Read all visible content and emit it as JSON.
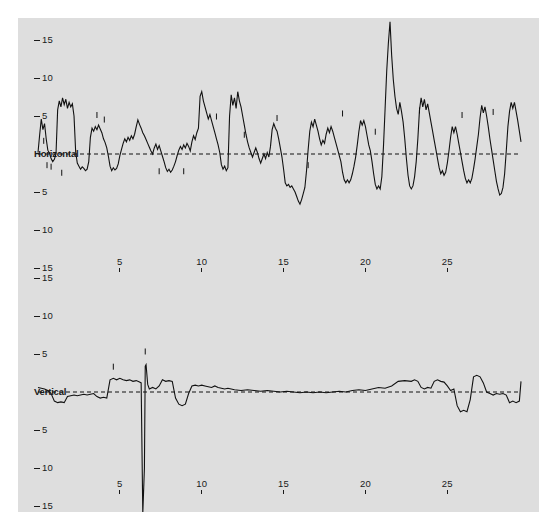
{
  "figure": {
    "background_color": "#ffffff",
    "plot_background_color": "#dedede",
    "line_color": "#111111",
    "zero_line_color": "#111111"
  },
  "chart_data": {
    "type": "line",
    "title": "",
    "subtitle": "",
    "xlabel": "",
    "ylabel": "",
    "grid": false,
    "legend_position": "none",
    "panels": [
      {
        "name": "horizontal",
        "center_label": "Horizontal",
        "ylabel": "",
        "ylim": [
          -18,
          18
        ],
        "xlim": [
          0,
          29.5
        ],
        "y_ticks": [
          15,
          10,
          5,
          0,
          -5,
          -10,
          -15
        ],
        "y_tick_labels": [
          "15",
          "10",
          "5",
          "Horizontal",
          "5",
          "10",
          "15"
        ],
        "x_ticks": [
          5,
          10,
          15,
          20,
          25
        ],
        "x_tick_labels": [
          "5",
          "10",
          "15",
          "20",
          "25"
        ],
        "zero_line": 0,
        "zero_line_style": "dashed",
        "x": [
          0.0,
          0.1,
          0.2,
          0.3,
          0.4,
          0.5,
          0.6,
          0.7,
          0.8,
          0.9,
          1.0,
          1.1,
          1.2,
          1.3,
          1.4,
          1.5,
          1.6,
          1.7,
          1.8,
          1.9,
          2.0,
          2.1,
          2.2,
          2.3,
          2.4,
          2.5,
          2.6,
          2.7,
          2.8,
          2.9,
          3.0,
          3.1,
          3.2,
          3.3,
          3.4,
          3.5,
          3.6,
          3.7,
          3.8,
          3.9,
          4.0,
          4.1,
          4.2,
          4.3,
          4.4,
          4.5,
          4.6,
          4.7,
          4.8,
          4.9,
          5.0,
          5.1,
          5.2,
          5.3,
          5.4,
          5.5,
          5.6,
          5.7,
          5.8,
          5.9,
          6.0,
          6.1,
          6.2,
          6.3,
          6.4,
          6.5,
          6.6,
          6.7,
          6.8,
          6.9,
          7.0,
          7.1,
          7.2,
          7.3,
          7.4,
          7.5,
          7.6,
          7.7,
          7.8,
          7.9,
          8.0,
          8.1,
          8.2,
          8.3,
          8.4,
          8.5,
          8.6,
          8.7,
          8.8,
          8.9,
          9.0,
          9.1,
          9.2,
          9.3,
          9.4,
          9.5,
          9.6,
          9.7,
          9.8,
          9.9,
          10.0,
          10.1,
          10.2,
          10.3,
          10.4,
          10.5,
          10.6,
          10.7,
          10.8,
          10.9,
          11.0,
          11.1,
          11.2,
          11.3,
          11.4,
          11.5,
          11.6,
          11.7,
          11.8,
          11.9,
          12.0,
          12.1,
          12.2,
          12.3,
          12.4,
          12.5,
          12.6,
          12.7,
          12.8,
          12.9,
          13.0,
          13.1,
          13.2,
          13.3,
          13.4,
          13.5,
          13.6,
          13.7,
          13.8,
          13.9,
          14.0,
          14.1,
          14.2,
          14.3,
          14.4,
          14.5,
          14.6,
          14.7,
          14.8,
          14.9,
          15.0,
          15.1,
          15.2,
          15.3,
          15.4,
          15.5,
          15.6,
          15.7,
          15.8,
          15.9,
          16.0,
          16.1,
          16.2,
          16.3,
          16.4,
          16.5,
          16.6,
          16.7,
          16.8,
          16.9,
          17.0,
          17.1,
          17.2,
          17.3,
          17.4,
          17.5,
          17.6,
          17.7,
          17.8,
          17.9,
          18.0,
          18.1,
          18.2,
          18.3,
          18.4,
          18.5,
          18.6,
          18.7,
          18.8,
          18.9,
          19.0,
          19.1,
          19.2,
          19.3,
          19.4,
          19.5,
          19.6,
          19.7,
          19.8,
          19.9,
          20.0,
          20.1,
          20.2,
          20.3,
          20.4,
          20.5,
          20.6,
          20.7,
          20.8,
          20.9,
          21.0,
          21.1,
          21.2,
          21.3,
          21.4,
          21.5,
          21.6,
          21.7,
          21.8,
          21.9,
          22.0,
          22.1,
          22.2,
          22.3,
          22.4,
          22.5,
          22.6,
          22.7,
          22.8,
          22.9,
          23.0,
          23.1,
          23.2,
          23.3,
          23.4,
          23.5,
          23.6,
          23.7,
          23.8,
          23.9,
          24.0,
          24.1,
          24.2,
          24.3,
          24.4,
          24.5,
          24.6,
          24.7,
          24.8,
          24.9,
          25.0,
          25.1,
          25.2,
          25.3,
          25.4,
          25.5,
          25.6,
          25.7,
          25.8,
          25.9,
          26.0,
          26.1,
          26.2,
          26.3,
          26.4,
          26.5,
          26.6,
          26.7,
          26.8,
          26.9,
          27.0,
          27.1,
          27.2,
          27.3,
          27.4,
          27.5,
          27.6,
          27.7,
          27.8,
          27.9,
          28.0,
          28.1,
          28.2,
          28.3,
          28.4,
          28.5,
          28.6,
          28.7,
          28.8,
          28.9,
          29.0,
          29.1,
          29.2,
          29.3,
          29.4,
          29.5
        ],
        "y": [
          0.2,
          2.5,
          4.6,
          3.2,
          4.0,
          2.0,
          0.5,
          0.1,
          -0.6,
          -1.0,
          -0.7,
          0.0,
          5.8,
          7.0,
          6.2,
          7.4,
          6.5,
          7.2,
          6.0,
          6.8,
          6.2,
          6.6,
          5.0,
          0.3,
          -1.2,
          -1.6,
          -2.0,
          -1.7,
          -1.9,
          -2.2,
          -2.0,
          -1.0,
          2.2,
          3.4,
          3.0,
          3.6,
          3.2,
          3.8,
          3.3,
          2.8,
          2.0,
          1.5,
          0.8,
          -0.3,
          -1.6,
          -2.2,
          -1.8,
          -2.1,
          -1.9,
          -1.3,
          -0.2,
          0.6,
          1.4,
          2.0,
          1.6,
          2.2,
          1.8,
          2.4,
          2.0,
          2.6,
          3.6,
          4.5,
          3.9,
          3.4,
          2.8,
          2.4,
          1.9,
          1.4,
          0.9,
          0.4,
          0.0,
          0.8,
          1.3,
          0.6,
          1.1,
          0.4,
          -0.3,
          -1.0,
          -1.8,
          -2.3,
          -2.0,
          -2.4,
          -2.1,
          -1.6,
          -1.0,
          -0.2,
          0.5,
          1.0,
          0.6,
          1.2,
          0.8,
          1.4,
          1.0,
          0.4,
          1.6,
          2.4,
          1.9,
          2.8,
          3.4,
          7.6,
          8.2,
          7.0,
          6.2,
          5.4,
          4.6,
          5.2,
          4.4,
          3.6,
          2.8,
          2.0,
          1.2,
          0.2,
          -1.4,
          -2.0,
          -1.6,
          -2.2,
          -1.8,
          5.0,
          7.8,
          6.4,
          7.4,
          6.0,
          8.2,
          7.0,
          6.2,
          5.0,
          3.8,
          2.6,
          1.6,
          0.8,
          0.2,
          -0.4,
          0.2,
          0.8,
          0.2,
          -0.6,
          -1.2,
          -0.6,
          0.0,
          -0.6,
          0.2,
          -0.4,
          1.0,
          3.2,
          4.0,
          3.4,
          3.0,
          2.0,
          0.8,
          -0.4,
          -2.0,
          -3.8,
          -4.2,
          -4.0,
          -4.4,
          -4.2,
          -4.6,
          -5.0,
          -5.6,
          -6.2,
          -6.6,
          -6.0,
          -5.2,
          -4.4,
          -2.2,
          0.6,
          3.0,
          4.2,
          3.6,
          4.6,
          3.8,
          3.0,
          2.0,
          1.2,
          1.8,
          1.4,
          2.6,
          3.4,
          2.8,
          3.6,
          3.0,
          2.2,
          1.4,
          0.6,
          -0.2,
          -1.0,
          -2.4,
          -3.4,
          -3.8,
          -3.4,
          -3.8,
          -3.4,
          -2.6,
          -1.6,
          -0.4,
          1.2,
          3.0,
          4.4,
          3.8,
          4.4,
          3.6,
          2.4,
          1.2,
          0.4,
          -1.0,
          -2.6,
          -4.0,
          -4.6,
          -4.2,
          -4.6,
          -3.0,
          1.0,
          6.0,
          11.0,
          14.6,
          17.4,
          13.0,
          9.8,
          7.6,
          6.0,
          5.2,
          6.8,
          5.6,
          4.2,
          2.0,
          -0.6,
          -2.8,
          -4.2,
          -4.6,
          -4.2,
          -3.0,
          -1.0,
          2.0,
          5.8,
          7.4,
          6.2,
          7.2,
          5.8,
          6.6,
          5.4,
          4.2,
          3.0,
          1.8,
          0.6,
          -0.6,
          -1.8,
          -2.6,
          -2.2,
          -2.8,
          -2.4,
          -1.2,
          0.4,
          2.2,
          3.6,
          2.8,
          3.6,
          2.6,
          1.4,
          0.2,
          -1.0,
          -2.2,
          -3.2,
          -3.8,
          -3.4,
          -3.8,
          -3.2,
          -2.0,
          -0.6,
          1.0,
          2.6,
          4.8,
          6.4,
          5.4,
          6.2,
          5.0,
          3.6,
          2.0,
          0.6,
          -0.8,
          -2.2,
          -3.6,
          -4.6,
          -5.4,
          -5.2,
          -4.4,
          -2.6,
          0.4,
          3.6,
          5.6,
          6.8,
          6.0,
          6.8,
          5.6,
          4.4,
          3.0,
          1.6,
          0.4,
          -0.8,
          -2.0,
          -3.0,
          -2.6,
          -3.0,
          -2.4,
          -1.2,
          0.6,
          2.6,
          4.6,
          5.8,
          5.0,
          5.8,
          4.6,
          3.2,
          1.8,
          0.6,
          -0.6,
          -1.6,
          -2.2,
          -1.8,
          -0.8,
          1.0,
          -1.0,
          -4.0,
          -7.6,
          -11.0,
          -14.2,
          -16.8,
          -18.0
        ],
        "event_markers": [
          {
            "x": 0.35,
            "y": 1.6
          },
          {
            "x": 0.55,
            "y": -1.6
          },
          {
            "x": 0.8,
            "y": -1.8
          },
          {
            "x": 1.45,
            "y": -2.6
          },
          {
            "x": 3.6,
            "y": 5.0
          },
          {
            "x": 4.05,
            "y": 4.4
          },
          {
            "x": 7.4,
            "y": -2.4
          },
          {
            "x": 8.9,
            "y": -2.4
          },
          {
            "x": 10.9,
            "y": 4.8
          },
          {
            "x": 12.6,
            "y": 2.4
          },
          {
            "x": 14.6,
            "y": 4.6
          },
          {
            "x": 16.5,
            "y": -1.6
          },
          {
            "x": 18.6,
            "y": 5.2
          },
          {
            "x": 20.6,
            "y": 2.8
          },
          {
            "x": 23.3,
            "y": 5.6
          },
          {
            "x": 25.9,
            "y": 5.0
          },
          {
            "x": 27.8,
            "y": 5.4
          }
        ]
      },
      {
        "name": "vertical",
        "center_label": "Vertical",
        "ylabel": "",
        "ylim": [
          -18,
          18
        ],
        "xlim": [
          0,
          29.5
        ],
        "y_ticks": [
          15,
          10,
          5,
          0,
          -5,
          -10,
          -15
        ],
        "y_tick_labels": [
          "15",
          "10",
          "5",
          "Vertical",
          "5",
          "10",
          "15"
        ],
        "x_ticks": [
          5,
          10,
          15,
          20,
          25
        ],
        "x_tick_labels": [
          "5",
          "10",
          "15",
          "20",
          "25"
        ],
        "zero_line": 0,
        "zero_line_style": "dashed",
        "x": [
          0.0,
          0.2,
          0.4,
          0.6,
          0.8,
          1.0,
          1.2,
          1.4,
          1.6,
          1.8,
          2.0,
          2.2,
          2.4,
          2.6,
          2.8,
          3.0,
          3.2,
          3.4,
          3.6,
          3.8,
          4.0,
          4.2,
          4.4,
          4.6,
          4.8,
          5.0,
          5.2,
          5.4,
          5.6,
          5.8,
          6.0,
          6.2,
          6.3,
          6.4,
          6.5,
          6.55,
          6.6,
          6.7,
          6.8,
          7.0,
          7.2,
          7.4,
          7.6,
          7.8,
          8.0,
          8.2,
          8.4,
          8.6,
          8.8,
          9.0,
          9.2,
          9.4,
          9.6,
          9.8,
          10.0,
          10.2,
          10.4,
          10.6,
          10.8,
          11.0,
          11.2,
          11.4,
          11.6,
          11.8,
          12.0,
          12.4,
          12.8,
          13.2,
          13.6,
          14.0,
          14.4,
          14.8,
          15.2,
          15.6,
          16.0,
          16.4,
          16.8,
          17.2,
          17.6,
          18.0,
          18.4,
          18.8,
          19.2,
          19.6,
          20.0,
          20.4,
          20.8,
          21.2,
          21.6,
          22.0,
          22.4,
          22.8,
          23.0,
          23.2,
          23.4,
          23.6,
          23.8,
          24.0,
          24.2,
          24.4,
          24.6,
          24.8,
          25.0,
          25.2,
          25.4,
          25.6,
          25.8,
          26.0,
          26.2,
          26.4,
          26.6,
          26.8,
          27.0,
          27.2,
          27.4,
          27.6,
          27.8,
          28.0,
          28.2,
          28.4,
          28.6,
          28.8,
          29.0,
          29.2,
          29.4,
          29.5
        ],
        "y": [
          0.6,
          0.5,
          0.4,
          0.2,
          -0.2,
          -1.2,
          -1.4,
          -1.3,
          -1.4,
          -0.6,
          -0.5,
          -0.4,
          -0.5,
          -0.4,
          -0.3,
          -0.4,
          -0.3,
          -0.2,
          -0.6,
          -0.8,
          -0.7,
          -0.8,
          1.6,
          1.8,
          1.6,
          1.8,
          1.6,
          1.5,
          1.6,
          1.4,
          1.5,
          1.3,
          1.2,
          -16.0,
          -10.0,
          3.4,
          3.6,
          1.0,
          0.4,
          0.6,
          0.4,
          0.8,
          1.6,
          1.4,
          1.5,
          1.4,
          -0.8,
          -1.6,
          -1.8,
          -1.6,
          -0.2,
          0.8,
          0.9,
          0.8,
          0.9,
          0.8,
          0.7,
          0.6,
          0.8,
          0.6,
          0.5,
          0.4,
          0.5,
          0.4,
          0.3,
          0.2,
          0.3,
          0.2,
          0.1,
          0.2,
          0.1,
          0.0,
          0.1,
          0.0,
          -0.1,
          0.0,
          -0.1,
          0.0,
          -0.1,
          0.0,
          0.1,
          0.0,
          0.2,
          0.3,
          0.2,
          0.4,
          0.6,
          0.5,
          0.8,
          1.4,
          1.5,
          1.4,
          1.6,
          1.4,
          0.6,
          0.4,
          0.6,
          0.5,
          1.4,
          1.6,
          1.4,
          1.3,
          0.8,
          0.2,
          0.4,
          -1.8,
          -2.6,
          -2.4,
          -2.6,
          -1.0,
          2.0,
          2.2,
          2.0,
          1.2,
          0.0,
          -0.2,
          -0.4,
          -0.2,
          -0.3,
          -0.2,
          -0.4,
          -1.4,
          -1.2,
          -1.4,
          -1.2,
          1.4,
          1.6
        ],
        "event_markers": [
          {
            "x": 4.6,
            "y": 3.2
          },
          {
            "x": 6.55,
            "y": 5.2
          }
        ]
      }
    ]
  }
}
